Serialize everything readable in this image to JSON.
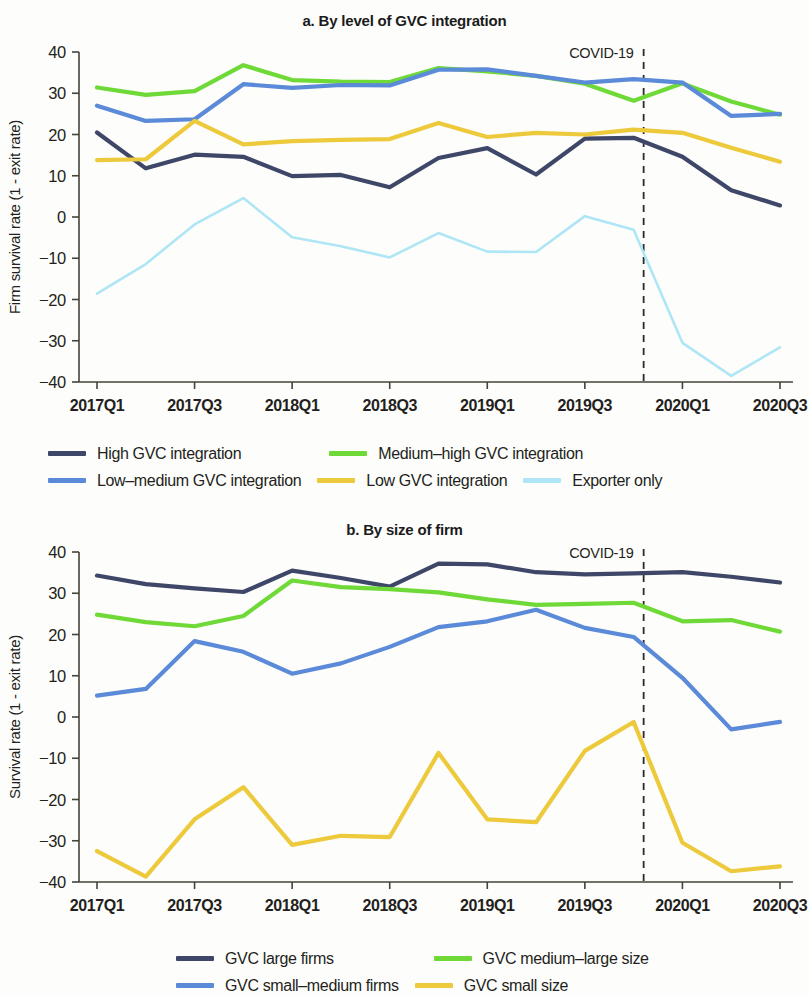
{
  "colors": {
    "high_gvc": "#3f4769",
    "medium_high_gvc": "#6fd938",
    "low_medium_gvc": "#5b8ad8",
    "low_gvc": "#edc93c",
    "exporter_only": "#aee6f5",
    "axis": "#45433a",
    "covid_rule": "#2b2b2b",
    "text": "#231f20"
  },
  "panel_a": {
    "title": "a. By level of GVC integration",
    "ylabel": "Firm survival rate (1 - exit rate)",
    "covid_label": "COVID-19",
    "legend": [
      {
        "label": "High GVC integration",
        "color": "#3f4769"
      },
      {
        "label": "Medium–high GVC integration",
        "color": "#6fd938"
      },
      {
        "label": "Low–medium GVC integration",
        "color": "#5b8ad8"
      },
      {
        "label": "Low GVC integration",
        "color": "#edc93c"
      },
      {
        "label": "Exporter only",
        "color": "#aee6f5"
      }
    ]
  },
  "panel_b": {
    "title": "b. By size of firm",
    "ylabel": "Survival rate (1 - exit rate)",
    "covid_label": "COVID-19",
    "legend": [
      {
        "label": "GVC large firms",
        "color": "#3f4769"
      },
      {
        "label": "GVC medium–large size",
        "color": "#6fd938"
      },
      {
        "label": "GVC small–medium firms",
        "color": "#5b8ad8"
      },
      {
        "label": "GVC small size",
        "color": "#edc93c"
      }
    ]
  },
  "chart_data": [
    {
      "type": "line",
      "title": "a. By level of GVC integration",
      "xlabel": "",
      "ylabel": "Firm survival rate (1 - exit rate)",
      "ylim": [
        -40,
        40
      ],
      "yticks": [
        -40,
        -30,
        -20,
        -10,
        0,
        10,
        20,
        30,
        40
      ],
      "grid": false,
      "legend_position": "below",
      "x": [
        "2017Q1",
        "2017Q2",
        "2017Q3",
        "2017Q4",
        "2018Q1",
        "2018Q2",
        "2018Q3",
        "2018Q4",
        "2019Q1",
        "2019Q2",
        "2019Q3",
        "2019Q4",
        "2020Q1",
        "2020Q2",
        "2020Q3"
      ],
      "xticks_labeled": [
        "2017Q1",
        "2017Q3",
        "2018Q1",
        "2018Q3",
        "2019Q1",
        "2019Q3",
        "2020Q1",
        "2020Q3"
      ],
      "annotations": [
        {
          "text": "COVID-19",
          "x": "2019Q4",
          "style": "dashed-vertical-rule"
        }
      ],
      "series": [
        {
          "name": "High GVC integration",
          "color": "#3f4769",
          "values": [
            20.5,
            11.8,
            15.1,
            14.6,
            9.9,
            10.2,
            7.2,
            14.3,
            16.7,
            10.3,
            19.0,
            19.2,
            14.6,
            6.5,
            2.8
          ]
        },
        {
          "name": "Medium–high GVC integration",
          "color": "#6fd938",
          "values": [
            31.4,
            29.6,
            30.5,
            36.8,
            33.2,
            32.8,
            32.7,
            36.1,
            35.3,
            34.2,
            32.3,
            28.2,
            32.4,
            28.0,
            24.8
          ]
        },
        {
          "name": "Low–medium GVC integration",
          "color": "#5b8ad8",
          "values": [
            27.0,
            23.3,
            23.7,
            32.2,
            31.3,
            32.0,
            31.9,
            35.7,
            35.8,
            34.2,
            32.6,
            33.4,
            32.6,
            24.5,
            25.0
          ]
        },
        {
          "name": "Low GVC integration",
          "color": "#edc93c",
          "values": [
            13.8,
            14.0,
            23.3,
            17.6,
            18.4,
            18.7,
            18.9,
            22.8,
            19.4,
            20.4,
            20.0,
            21.2,
            20.4,
            16.8,
            13.4
          ]
        },
        {
          "name": "Exporter only",
          "color": "#aee6f5",
          "values": [
            -18.6,
            -11.4,
            -1.8,
            4.6,
            -4.9,
            -7.1,
            -9.8,
            -3.9,
            -8.4,
            -8.5,
            0.2,
            -3.1,
            -30.5,
            -38.5,
            -31.6
          ]
        }
      ]
    },
    {
      "type": "line",
      "title": "b. By size of firm",
      "xlabel": "",
      "ylabel": "Survival rate (1 - exit rate)",
      "ylim": [
        -40,
        40
      ],
      "yticks": [
        -40,
        -30,
        -20,
        -10,
        0,
        10,
        20,
        30,
        40
      ],
      "grid": false,
      "legend_position": "below",
      "x": [
        "2017Q1",
        "2017Q2",
        "2017Q3",
        "2017Q4",
        "2018Q1",
        "2018Q2",
        "2018Q3",
        "2018Q4",
        "2019Q1",
        "2019Q2",
        "2019Q3",
        "2019Q4",
        "2020Q1",
        "2020Q2",
        "2020Q3"
      ],
      "xticks_labeled": [
        "2017Q1",
        "2017Q3",
        "2018Q1",
        "2018Q3",
        "2019Q1",
        "2019Q3",
        "2020Q1",
        "2020Q3"
      ],
      "annotations": [
        {
          "text": "COVID-19",
          "x": "2019Q4",
          "style": "dashed-vertical-rule"
        }
      ],
      "series": [
        {
          "name": "GVC large firms",
          "color": "#3f4769",
          "values": [
            34.3,
            32.2,
            31.2,
            30.3,
            35.5,
            33.7,
            31.6,
            37.2,
            37.0,
            35.1,
            34.6,
            34.8,
            35.1,
            34.0,
            32.6
          ]
        },
        {
          "name": "GVC medium–large size",
          "color": "#6fd938",
          "values": [
            24.8,
            23.0,
            22.0,
            24.5,
            33.1,
            31.5,
            31.0,
            30.2,
            28.5,
            27.2,
            27.4,
            27.7,
            23.2,
            23.5,
            20.7
          ]
        },
        {
          "name": "GVC small–medium firms",
          "color": "#5b8ad8",
          "values": [
            5.2,
            6.8,
            18.4,
            15.8,
            10.5,
            13.0,
            17.0,
            21.8,
            23.2,
            26.0,
            21.6,
            19.4,
            9.5,
            -3.0,
            -1.2
          ]
        },
        {
          "name": "GVC small size",
          "color": "#edc93c",
          "values": [
            -32.5,
            -38.7,
            -24.8,
            -17.0,
            -31.0,
            -28.8,
            -29.1,
            -8.7,
            -24.8,
            -25.5,
            -8.2,
            -1.2,
            -30.5,
            -37.4,
            -36.2
          ]
        }
      ]
    }
  ]
}
